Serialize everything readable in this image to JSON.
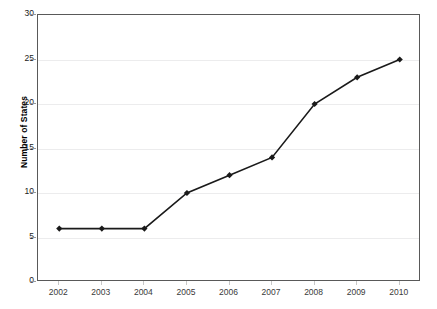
{
  "chart_data": {
    "type": "line",
    "title": "",
    "xlabel": "",
    "ylabel": "Number of States",
    "categories": [
      "2002",
      "2003",
      "2004",
      "2005",
      "2006",
      "2007",
      "2008",
      "2009",
      "2010"
    ],
    "x": [
      2002,
      2003,
      2004,
      2005,
      2006,
      2007,
      2008,
      2009,
      2010
    ],
    "values": [
      6,
      6,
      6,
      10,
      12,
      14,
      20,
      23,
      25
    ],
    "series": [
      {
        "name": "Number of States",
        "values": [
          6,
          6,
          6,
          10,
          12,
          14,
          20,
          23,
          25
        ]
      }
    ],
    "ylim": [
      0,
      30
    ],
    "y_ticks": [
      0,
      5,
      10,
      15,
      20,
      25,
      30
    ],
    "y_tick_labels": [
      "0",
      "5",
      "10",
      "15",
      "20",
      "25",
      "30"
    ],
    "grid": true,
    "grid_axis": "y",
    "legend": false,
    "legend_position": "none",
    "marker": "diamond",
    "line_color": "#1a1a1a",
    "marker_color": "#1a1a1a",
    "grid_color": "#ececed",
    "axis_color": "#595959",
    "background_color": "#ffffff"
  }
}
